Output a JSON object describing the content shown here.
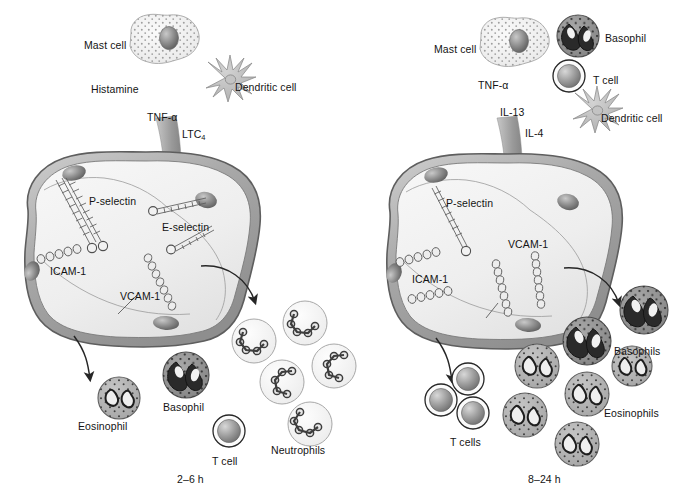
{
  "figure": {
    "type": "biomedical-diagram",
    "background_color": "#ffffff"
  },
  "panels": [
    {
      "id": "left",
      "caption": "2–6 h",
      "caption_x": 177,
      "caption_y": 474,
      "mediator_labels": [
        {
          "id": "histamine",
          "text": "Histamine",
          "x": 91,
          "y": 84
        },
        {
          "id": "tnf-alpha",
          "text": "TNF-α",
          "x": 147,
          "y": 112
        },
        {
          "id": "ltc4",
          "text": "LTC",
          "sub": "4",
          "x": 182,
          "y": 129
        }
      ],
      "cell_legend": [
        {
          "id": "mast-cell",
          "text": "Mast cell",
          "x": 84,
          "y": 40
        },
        {
          "id": "dendritic-cell",
          "text": "Dendritic cell",
          "x": 235,
          "y": 82
        }
      ],
      "endothelium": {
        "molecules": [
          {
            "id": "p-selectin",
            "text": "P-selectin",
            "x": 89,
            "y": 196
          },
          {
            "id": "e-selectin",
            "text": "E-selectin",
            "x": 162,
            "y": 222
          },
          {
            "id": "icam-1",
            "text": "ICAM-1",
            "x": 50,
            "y": 266
          },
          {
            "id": "vcam-1",
            "text": "VCAM-1",
            "x": 120,
            "y": 291
          }
        ]
      },
      "recruited_cells": [
        {
          "id": "eosinophil",
          "text": "Eosinophil",
          "x": 78,
          "y": 421
        },
        {
          "id": "basophil",
          "text": "Basophil",
          "x": 163,
          "y": 402
        },
        {
          "id": "t-cell",
          "text": "T cell",
          "x": 212,
          "y": 456
        },
        {
          "id": "neutrophils",
          "text": "Neutrophils",
          "x": 271,
          "y": 445
        }
      ]
    },
    {
      "id": "right",
      "caption": "8–24 h",
      "caption_x": 528,
      "caption_y": 474,
      "mediator_labels": [
        {
          "id": "tnf-alpha",
          "text": "TNF-α",
          "x": 478,
          "y": 80
        },
        {
          "id": "il-13",
          "text": "IL-13",
          "x": 500,
          "y": 107
        },
        {
          "id": "il-4",
          "text": "IL-4",
          "x": 525,
          "y": 128
        }
      ],
      "cell_legend": [
        {
          "id": "mast-cell",
          "text": "Mast cell",
          "x": 434,
          "y": 44
        },
        {
          "id": "basophil",
          "text": "Basophil",
          "x": 605,
          "y": 33
        },
        {
          "id": "t-cell",
          "text": "T cell",
          "x": 593,
          "y": 75
        },
        {
          "id": "dendritic-cell",
          "text": "Dendritic cell",
          "x": 601,
          "y": 113
        }
      ],
      "endothelium": {
        "molecules": [
          {
            "id": "p-selectin",
            "text": "P-selectin",
            "x": 446,
            "y": 198
          },
          {
            "id": "icam-1",
            "text": "ICAM-1",
            "x": 412,
            "y": 274
          },
          {
            "id": "vcam-1",
            "text": "VCAM-1",
            "x": 508,
            "y": 239
          }
        ]
      },
      "recruited_cells": [
        {
          "id": "t-cells",
          "text": "T cells",
          "x": 450,
          "y": 437
        },
        {
          "id": "basophils",
          "text": "Basophils",
          "x": 614,
          "y": 346
        },
        {
          "id": "eosinophils",
          "text": "Eosinophils",
          "x": 604,
          "y": 408
        }
      ]
    }
  ],
  "colors": {
    "ink": "#141414",
    "membrane_outline": "#6e6e6e",
    "membrane_fill": "#b9b9b9",
    "cytoplasm": "#f0f0f0",
    "nucleus_dark": "#5b5b5b",
    "granule": "#2b2b2b",
    "eosinophil_fill": "#b3b3b3",
    "basophil_fill": "#8f8f8f",
    "neutrophil_fill": "#f4f4f4",
    "arrow": "#3a3a3a"
  }
}
